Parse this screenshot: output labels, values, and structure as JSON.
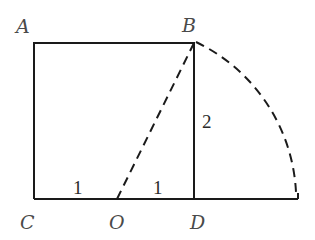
{
  "diagram": {
    "points": {
      "A": {
        "label": "A"
      },
      "B": {
        "label": "B"
      },
      "C": {
        "label": "C"
      },
      "O": {
        "label": "O"
      },
      "D": {
        "label": "D"
      }
    },
    "lengths": {
      "CO": "1",
      "OD": "1",
      "BD": "2"
    },
    "colors": {
      "stroke": "#1a1a1a",
      "label": "#4a4a4a",
      "background": "#ffffff"
    }
  }
}
